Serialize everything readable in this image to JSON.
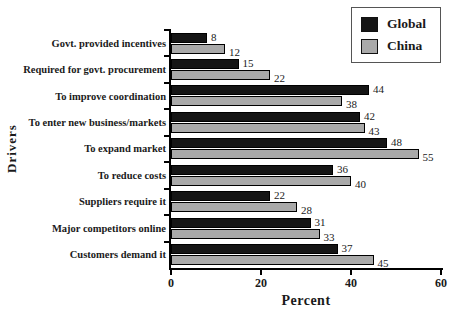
{
  "chart_data": {
    "type": "bar",
    "orientation": "horizontal",
    "title": "",
    "xlabel": "Percent",
    "ylabel": "Drivers",
    "xlim": [
      0,
      60
    ],
    "xticks": [
      0,
      20,
      40,
      60
    ],
    "grid": false,
    "value_labels": true,
    "legend_position": "top-right",
    "categories": [
      "Govt. provided incentives",
      "Required for govt. procurement",
      "To improve coordination",
      "To enter new business/markets",
      "To expand market",
      "To reduce costs",
      "Suppliers require it",
      "Major competitors online",
      "Customers demand it"
    ],
    "series": [
      {
        "name": "Global",
        "color": "#151515",
        "values": [
          8,
          15,
          44,
          42,
          48,
          36,
          22,
          31,
          37
        ]
      },
      {
        "name": "China",
        "color": "#a9a9a9",
        "values": [
          12,
          22,
          38,
          43,
          55,
          40,
          28,
          33,
          45
        ]
      }
    ]
  }
}
